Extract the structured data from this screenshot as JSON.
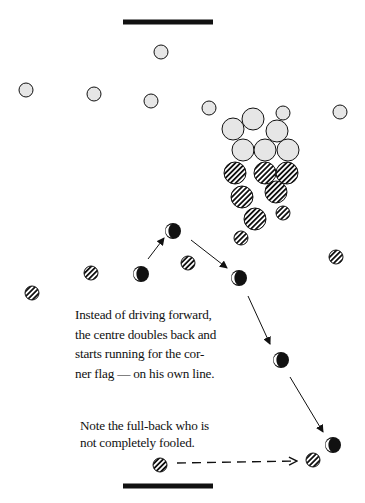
{
  "colors": {
    "ink": "#111111",
    "light_fill": "#e6e6e6",
    "background": "#ffffff"
  },
  "goal_lines": [
    {
      "name": "top-goal-line",
      "x1": 123,
      "x2": 213,
      "y": 22
    },
    {
      "name": "bottom-goal-line",
      "x1": 123,
      "x2": 213,
      "y": 486
    }
  ],
  "light_players": [
    {
      "x": 161,
      "y": 52,
      "r": 7
    },
    {
      "x": 26,
      "y": 90,
      "r": 7
    },
    {
      "x": 94,
      "y": 94,
      "r": 7
    },
    {
      "x": 151,
      "y": 101,
      "r": 7
    },
    {
      "x": 209,
      "y": 108,
      "r": 7
    },
    {
      "x": 340,
      "y": 112,
      "r": 7
    },
    {
      "x": 283,
      "y": 113,
      "r": 7
    },
    {
      "x": 253,
      "y": 119,
      "r": 11
    },
    {
      "x": 233,
      "y": 129,
      "r": 11
    },
    {
      "x": 277,
      "y": 131,
      "r": 11
    },
    {
      "x": 243,
      "y": 150,
      "r": 11
    },
    {
      "x": 265,
      "y": 150,
      "r": 11
    },
    {
      "x": 288,
      "y": 150,
      "r": 11
    }
  ],
  "hatched_players": [
    {
      "x": 235,
      "y": 173,
      "r": 11
    },
    {
      "x": 265,
      "y": 173,
      "r": 11
    },
    {
      "x": 287,
      "y": 173,
      "r": 11
    },
    {
      "x": 276,
      "y": 192,
      "r": 11
    },
    {
      "x": 242,
      "y": 197,
      "r": 11
    },
    {
      "x": 283,
      "y": 213,
      "r": 7
    },
    {
      "x": 255,
      "y": 219,
      "r": 11
    },
    {
      "x": 241,
      "y": 238,
      "r": 7
    },
    {
      "x": 336,
      "y": 257,
      "r": 7
    },
    {
      "x": 188,
      "y": 263,
      "r": 7
    },
    {
      "x": 91,
      "y": 273,
      "r": 7
    },
    {
      "x": 32,
      "y": 293,
      "r": 7
    },
    {
      "x": 160,
      "y": 465,
      "r": 7
    },
    {
      "x": 313,
      "y": 460,
      "r": 7
    }
  ],
  "centre_positions": [
    {
      "x": 141,
      "y": 274,
      "r": 8
    },
    {
      "x": 173,
      "y": 231,
      "r": 8
    },
    {
      "x": 239,
      "y": 278,
      "r": 8
    },
    {
      "x": 281,
      "y": 360,
      "r": 8
    },
    {
      "x": 333,
      "y": 445,
      "r": 8
    }
  ],
  "run_arrows": [
    {
      "x1": 148,
      "y1": 259,
      "x2": 164,
      "y2": 238
    },
    {
      "x1": 191,
      "y1": 240,
      "x2": 227,
      "y2": 268
    },
    {
      "x1": 248,
      "y1": 296,
      "x2": 270,
      "y2": 344
    },
    {
      "x1": 290,
      "y1": 377,
      "x2": 323,
      "y2": 432
    }
  ],
  "fullback_arrow": {
    "x1": 177,
    "y1": 463,
    "x2": 297,
    "y2": 461
  },
  "captions": {
    "run": [
      "Instead of driving forward,",
      "the centre doubles back and",
      "starts running for the cor-",
      "ner flag — on his own line."
    ],
    "fullback": [
      "Note the full-back who is",
      "not completely fooled."
    ]
  }
}
